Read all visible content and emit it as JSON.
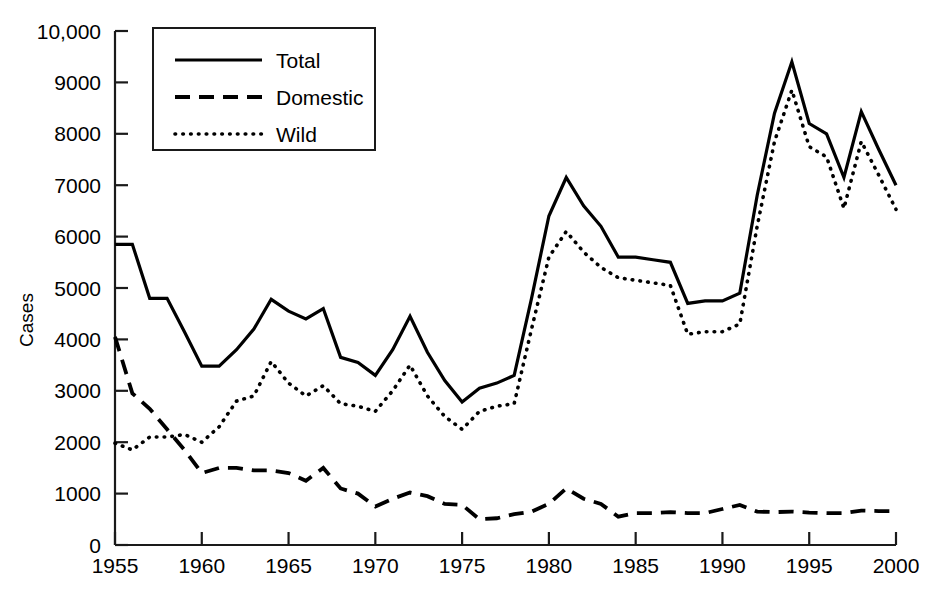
{
  "chart_data": {
    "type": "line",
    "title": "",
    "xlabel": "",
    "ylabel": "Cases",
    "xlim": [
      1955,
      2000
    ],
    "ylim": [
      0,
      10000
    ],
    "grid": false,
    "legend_position": "top-left",
    "x_ticks": [
      "1955",
      "1960",
      "1965",
      "1970",
      "1975",
      "1980",
      "1985",
      "1990",
      "1995",
      "2000"
    ],
    "x_tick_values": [
      1955,
      1960,
      1965,
      1970,
      1975,
      1980,
      1985,
      1990,
      1995,
      2000
    ],
    "y_ticks": [
      "0",
      "1000",
      "2000",
      "3000",
      "4000",
      "5000",
      "6000",
      "7000",
      "8000",
      "9000",
      "10,000"
    ],
    "y_tick_values": [
      0,
      1000,
      2000,
      3000,
      4000,
      5000,
      6000,
      7000,
      8000,
      9000,
      10000
    ],
    "x": [
      1955,
      1956,
      1957,
      1958,
      1959,
      1960,
      1961,
      1962,
      1963,
      1964,
      1965,
      1966,
      1967,
      1968,
      1969,
      1970,
      1971,
      1972,
      1973,
      1974,
      1975,
      1976,
      1977,
      1978,
      1979,
      1980,
      1981,
      1982,
      1983,
      1984,
      1985,
      1986,
      1987,
      1988,
      1989,
      1990,
      1991,
      1992,
      1993,
      1994,
      1995,
      1996,
      1997,
      1998,
      1999,
      2000
    ],
    "series": [
      {
        "name": "Total",
        "style": "solid",
        "values": [
          5850,
          5850,
          4800,
          4800,
          4150,
          3480,
          3480,
          3800,
          4200,
          4780,
          4550,
          4400,
          4600,
          3650,
          3550,
          3300,
          3800,
          4450,
          3750,
          3200,
          2780,
          3050,
          3150,
          3300,
          4800,
          6400,
          7150,
          6600,
          6200,
          5600,
          5600,
          5550,
          5500,
          4700,
          4750,
          4750,
          4900,
          6800,
          8400,
          9400,
          8200,
          8000,
          7150,
          8430,
          7700,
          7000
        ]
      },
      {
        "name": "Domestic",
        "style": "dashed",
        "values": [
          4050,
          2950,
          2650,
          2250,
          1850,
          1400,
          1500,
          1500,
          1450,
          1450,
          1400,
          1250,
          1500,
          1100,
          1000,
          750,
          900,
          1020,
          950,
          800,
          780,
          500,
          520,
          600,
          650,
          800,
          1100,
          900,
          800,
          550,
          620,
          620,
          640,
          620,
          620,
          700,
          780,
          650,
          640,
          650,
          630,
          620,
          620,
          670,
          660,
          660
        ]
      },
      {
        "name": "Wild",
        "style": "dotted",
        "values": [
          1980,
          1850,
          2100,
          2100,
          2150,
          2000,
          2300,
          2800,
          2900,
          3570,
          3150,
          2900,
          3100,
          2750,
          2700,
          2600,
          3000,
          3500,
          2900,
          2500,
          2250,
          2600,
          2700,
          2750,
          4200,
          5600,
          6100,
          5700,
          5400,
          5200,
          5150,
          5100,
          5050,
          4100,
          4150,
          4150,
          4300,
          6200,
          7850,
          8850,
          7750,
          7550,
          6550,
          7850,
          7200,
          6530
        ]
      }
    ]
  },
  "legend": {
    "items": [
      {
        "label": "Total",
        "style": "solid"
      },
      {
        "label": "Domestic",
        "style": "dashed"
      },
      {
        "label": "Wild",
        "style": "dotted"
      }
    ]
  }
}
